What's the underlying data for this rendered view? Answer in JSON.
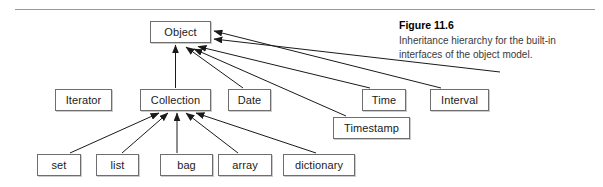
{
  "figure": {
    "caption_title": "Figure 11.6",
    "caption_line1": "Inheritance hierarchy for the built-in",
    "caption_line2": "interfaces of the object model."
  },
  "colors": {
    "box_border": "#6e6e6e",
    "box_fill": "#ffffff",
    "edge": "#1a1a1a",
    "rule": "#9a9a9a",
    "text": "#1a1a1a"
  },
  "diagram": {
    "type": "inheritance-hierarchy",
    "root": "Object",
    "nodes": [
      {
        "id": "object",
        "label": "Object",
        "x": 150,
        "y": 21,
        "w": 61,
        "h": 22
      },
      {
        "id": "iterator",
        "label": "Iterator",
        "x": 55,
        "y": 89,
        "w": 57,
        "h": 22
      },
      {
        "id": "collection",
        "label": "Collection",
        "x": 140,
        "y": 89,
        "w": 71,
        "h": 22
      },
      {
        "id": "date",
        "label": "Date",
        "x": 228,
        "y": 89,
        "w": 43,
        "h": 22
      },
      {
        "id": "time",
        "label": "Time",
        "x": 362,
        "y": 89,
        "w": 44,
        "h": 22
      },
      {
        "id": "interval",
        "label": "Interval",
        "x": 430,
        "y": 89,
        "w": 59,
        "h": 22
      },
      {
        "id": "timestamp",
        "label": "Timestamp",
        "x": 333,
        "y": 117,
        "w": 77,
        "h": 22
      },
      {
        "id": "set",
        "label": "set",
        "x": 37,
        "y": 154,
        "w": 44,
        "h": 22
      },
      {
        "id": "list",
        "label": "list",
        "x": 96,
        "y": 154,
        "w": 43,
        "h": 22
      },
      {
        "id": "bag",
        "label": "bag",
        "x": 160,
        "y": 154,
        "w": 53,
        "h": 22
      },
      {
        "id": "array",
        "label": "array",
        "x": 218,
        "y": 154,
        "w": 54,
        "h": 22
      },
      {
        "id": "dictionary",
        "label": "dictionary",
        "x": 283,
        "y": 154,
        "w": 72,
        "h": 22
      }
    ],
    "edges": [
      {
        "from": "collection",
        "to": "object",
        "relation": "inherits"
      },
      {
        "from": "date",
        "to": "object",
        "relation": "inherits"
      },
      {
        "from": "time",
        "to": "object",
        "relation": "inherits"
      },
      {
        "from": "timestamp",
        "to": "object",
        "relation": "inherits"
      },
      {
        "from": "interval",
        "to": "object",
        "relation": "inherits"
      },
      {
        "from": "set",
        "to": "collection",
        "relation": "inherits"
      },
      {
        "from": "list",
        "to": "collection",
        "relation": "inherits"
      },
      {
        "from": "bag",
        "to": "collection",
        "relation": "inherits"
      },
      {
        "from": "array",
        "to": "collection",
        "relation": "inherits"
      },
      {
        "from": "dictionary",
        "to": "collection",
        "relation": "inherits"
      }
    ]
  }
}
